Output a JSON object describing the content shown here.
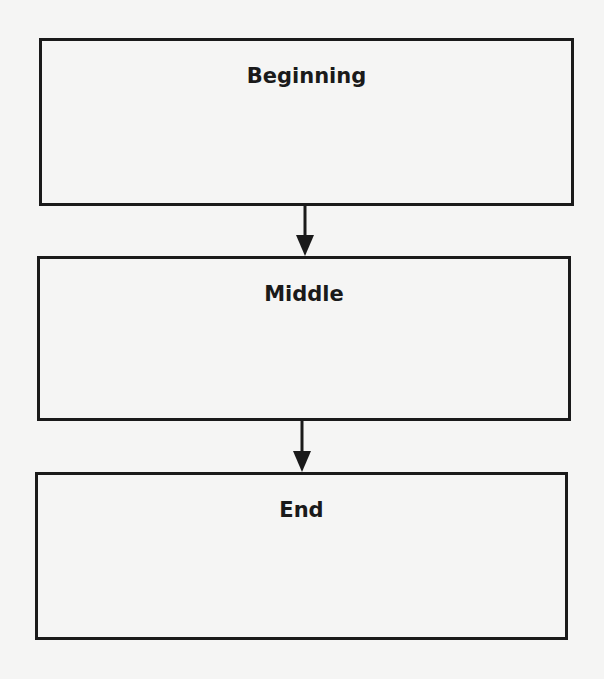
{
  "diagram": {
    "type": "flowchart",
    "direction": "top-to-bottom",
    "nodes": [
      {
        "id": "beginning",
        "label": "Beginning"
      },
      {
        "id": "middle",
        "label": "Middle"
      },
      {
        "id": "end",
        "label": "End"
      }
    ],
    "edges": [
      {
        "from": "beginning",
        "to": "middle"
      },
      {
        "from": "middle",
        "to": "end"
      }
    ],
    "colors": {
      "background": "#f5f5f4",
      "stroke": "#1a1a1a",
      "text": "#1a1a1a"
    }
  }
}
